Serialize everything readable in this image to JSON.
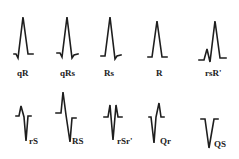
{
  "diagram": {
    "stroke_color": "#1e1e1e",
    "background": "#ffffff",
    "rows": [
      {
        "items": [
          {
            "label": "qR",
            "shape": "qR"
          },
          {
            "label": "qRs",
            "shape": "qRs"
          },
          {
            "label": "Rs",
            "shape": "Rs"
          },
          {
            "label": "R",
            "shape": "R"
          },
          {
            "label": "rsR'",
            "shape": "rsR-prime"
          }
        ]
      },
      {
        "items": [
          {
            "label": "rS",
            "shape": "rS"
          },
          {
            "label": "RS",
            "shape": "RS"
          },
          {
            "label": "rSr'",
            "shape": "rSr-prime"
          },
          {
            "label": "Qr",
            "shape": "Qr"
          },
          {
            "label": "QS",
            "shape": "QS"
          }
        ]
      }
    ]
  }
}
